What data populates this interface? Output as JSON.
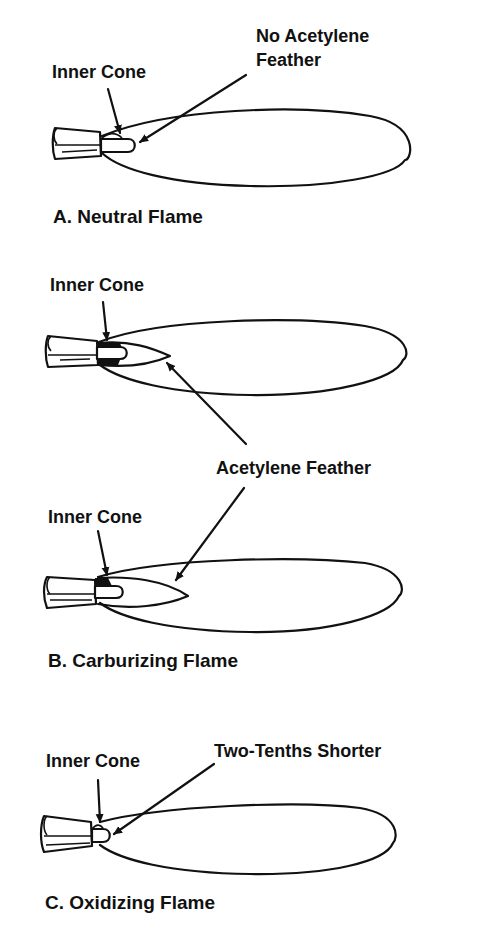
{
  "figure": {
    "panels": [
      {
        "id": "A",
        "caption": "A.  Neutral Flame",
        "labels": {
          "inner_cone": "Inner Cone",
          "callout_line1": "No Acetylene",
          "callout_line2": "Feather"
        }
      },
      {
        "id": "B",
        "caption": "B.  Carburizing Flame",
        "labels": {
          "inner_cone_top": "Inner Cone",
          "inner_cone_bottom": "Inner Cone",
          "shared_callout": "Acetylene Feather"
        }
      },
      {
        "id": "C",
        "caption": "C.  Oxidizing Flame",
        "labels": {
          "inner_cone": "Inner Cone",
          "callout": "Two-Tenths Shorter"
        }
      }
    ],
    "colors": {
      "ink": "#111111",
      "background": "#ffffff"
    }
  }
}
